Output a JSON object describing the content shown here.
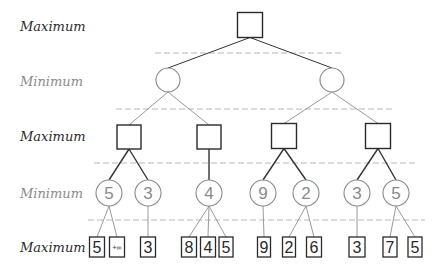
{
  "colors": {
    "max": "#2a2a2a",
    "min": "#8a8a8a",
    "edge_max": "#333333",
    "edge_min": "#9a9a9a",
    "divider": "#b8b8b8",
    "background": "#ffffff"
  },
  "levels": [
    {
      "label": "Maximum",
      "type": "max",
      "y": 26
    },
    {
      "label": "Minimum",
      "type": "min",
      "y": 81
    },
    {
      "label": "Maximum",
      "type": "max",
      "y": 136
    },
    {
      "label": "Minimum",
      "type": "min",
      "y": 193
    },
    {
      "label": "Maximum",
      "type": "max",
      "y": 247
    }
  ],
  "dividers": [
    {
      "y": 53,
      "x1": 155,
      "x2": 343
    },
    {
      "y": 109,
      "x1": 116,
      "x2": 392
    },
    {
      "y": 163,
      "x1": 94,
      "x2": 415
    },
    {
      "y": 220,
      "x1": 88,
      "x2": 425
    }
  ],
  "nodes": [
    {
      "id": "r",
      "shape": "square",
      "x": 250,
      "y": 25,
      "size": 25,
      "value": ""
    },
    {
      "id": "a",
      "shape": "circle",
      "x": 168,
      "y": 80,
      "r": 12,
      "value": "",
      "parent": "r"
    },
    {
      "id": "b",
      "shape": "circle",
      "x": 332,
      "y": 80,
      "r": 12,
      "value": "",
      "parent": "r"
    },
    {
      "id": "a1",
      "shape": "square",
      "x": 129,
      "y": 137,
      "size": 24,
      "value": "",
      "parent": "a"
    },
    {
      "id": "a2",
      "shape": "square",
      "x": 209,
      "y": 137,
      "size": 24,
      "value": "",
      "parent": "a"
    },
    {
      "id": "b1",
      "shape": "square",
      "x": 284,
      "y": 136,
      "size": 25,
      "value": "",
      "parent": "b"
    },
    {
      "id": "b2",
      "shape": "square",
      "x": 378,
      "y": 136,
      "size": 25,
      "value": "",
      "parent": "b"
    },
    {
      "id": "c1",
      "shape": "circle",
      "x": 109,
      "y": 193,
      "r": 13,
      "value": "5",
      "parent": "a1"
    },
    {
      "id": "c2",
      "shape": "circle",
      "x": 148,
      "y": 193,
      "r": 13,
      "value": "3",
      "parent": "a1"
    },
    {
      "id": "c3",
      "shape": "circle",
      "x": 209,
      "y": 193,
      "r": 13,
      "value": "4",
      "parent": "a2"
    },
    {
      "id": "c4",
      "shape": "circle",
      "x": 263,
      "y": 193,
      "r": 13,
      "value": "9",
      "parent": "b1"
    },
    {
      "id": "c5",
      "shape": "circle",
      "x": 306,
      "y": 193,
      "r": 13,
      "value": "2",
      "parent": "b1"
    },
    {
      "id": "c6",
      "shape": "circle",
      "x": 357,
      "y": 193,
      "r": 13,
      "value": "3",
      "parent": "b2"
    },
    {
      "id": "c7",
      "shape": "circle",
      "x": 396,
      "y": 193,
      "r": 13,
      "value": "5",
      "parent": "b2"
    },
    {
      "id": "l1",
      "shape": "leaf",
      "x": 97,
      "y": 247,
      "w": 15,
      "h": 20,
      "value": "5",
      "parent": "c1"
    },
    {
      "id": "l2",
      "shape": "leaf",
      "x": 117,
      "y": 247,
      "w": 15,
      "h": 20,
      "value": "+∞",
      "small": true,
      "parent": "c1"
    },
    {
      "id": "l3",
      "shape": "leaf",
      "x": 148,
      "y": 247,
      "w": 15,
      "h": 20,
      "value": "3",
      "parent": "c2"
    },
    {
      "id": "l4",
      "shape": "leaf",
      "x": 189,
      "y": 247,
      "w": 15,
      "h": 20,
      "value": "8",
      "parent": "c3"
    },
    {
      "id": "l5",
      "shape": "leaf",
      "x": 208,
      "y": 247,
      "w": 15,
      "h": 20,
      "value": "4",
      "parent": "c3"
    },
    {
      "id": "l6",
      "shape": "leaf",
      "x": 226,
      "y": 247,
      "w": 14,
      "h": 20,
      "value": "5",
      "parent": "c3"
    },
    {
      "id": "l7",
      "shape": "leaf",
      "x": 264,
      "y": 247,
      "w": 13,
      "h": 20,
      "value": "9",
      "parent": "c4"
    },
    {
      "id": "l8",
      "shape": "leaf",
      "x": 289,
      "y": 247,
      "w": 13,
      "h": 20,
      "value": "2",
      "parent": "c5"
    },
    {
      "id": "l9",
      "shape": "leaf",
      "x": 314,
      "y": 247,
      "w": 15,
      "h": 20,
      "value": "6",
      "parent": "c5"
    },
    {
      "id": "l10",
      "shape": "leaf",
      "x": 357,
      "y": 247,
      "w": 16,
      "h": 20,
      "value": "3",
      "parent": "c6"
    },
    {
      "id": "l11",
      "shape": "leaf",
      "x": 390,
      "y": 247,
      "w": 14,
      "h": 20,
      "value": "7",
      "parent": "c7"
    },
    {
      "id": "l12",
      "shape": "leaf",
      "x": 415,
      "y": 247,
      "w": 14,
      "h": 20,
      "value": "5",
      "parent": "c7"
    }
  ]
}
